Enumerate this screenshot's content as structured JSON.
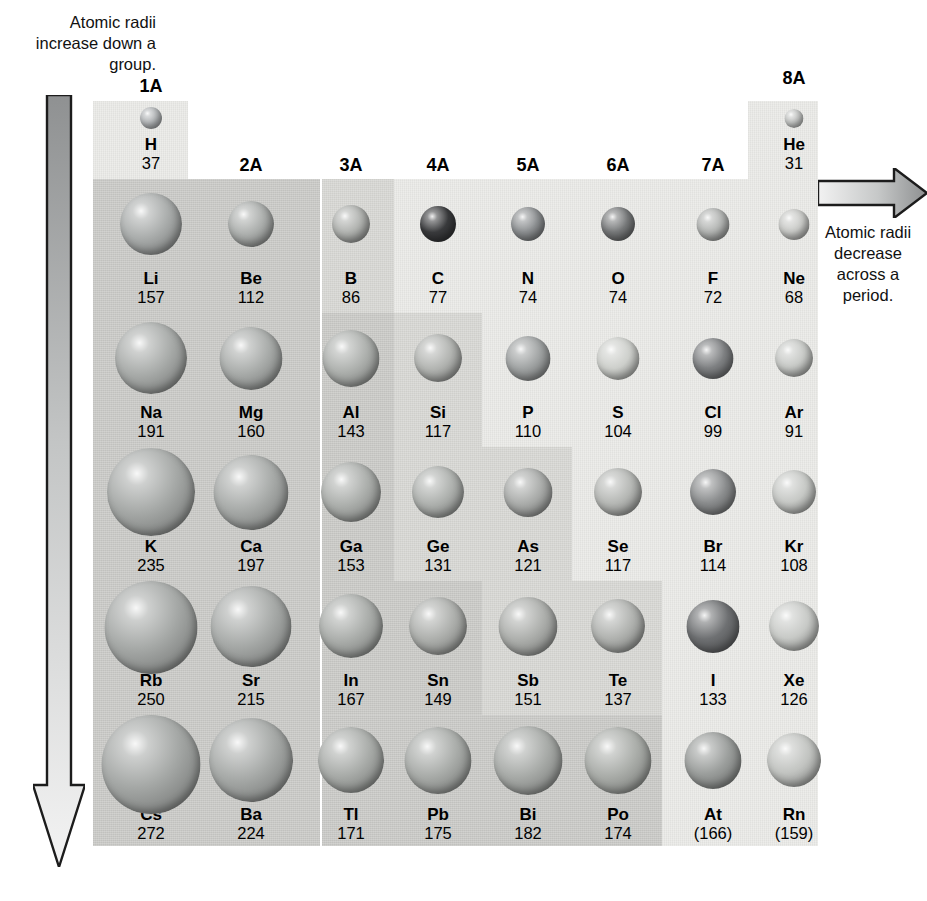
{
  "annotations": {
    "down": "Atomic radii increase down a group.",
    "across": "Atomic radii decrease across a period.",
    "down_icon": "down-arrow-icon",
    "across_icon": "right-arrow-icon"
  },
  "groups": [
    "1A",
    "2A",
    "3A",
    "4A",
    "5A",
    "6A",
    "7A",
    "8A"
  ],
  "chart_data": {
    "type": "table",
    "xlabel": "Group",
    "ylabel": "Period",
    "units": "pm",
    "categories": [
      "1A",
      "2A",
      "3A",
      "4A",
      "5A",
      "6A",
      "7A",
      "8A"
    ],
    "note": "Sphere diameter is proportional to the atomic radius value shown beneath each symbol. Values in parentheses are estimates.",
    "series": [
      {
        "name": "Period 1",
        "symbols": [
          "H",
          null,
          null,
          null,
          null,
          null,
          null,
          "He"
        ],
        "values": [
          37,
          null,
          null,
          null,
          null,
          null,
          null,
          31
        ]
      },
      {
        "name": "Period 2",
        "symbols": [
          "Li",
          "Be",
          "B",
          "C",
          "N",
          "O",
          "F",
          "Ne"
        ],
        "values": [
          157,
          112,
          86,
          77,
          74,
          74,
          72,
          68
        ]
      },
      {
        "name": "Period 3",
        "symbols": [
          "Na",
          "Mg",
          "Al",
          "Si",
          "P",
          "S",
          "Cl",
          "Ar"
        ],
        "values": [
          191,
          160,
          143,
          117,
          110,
          104,
          99,
          91
        ]
      },
      {
        "name": "Period 4",
        "symbols": [
          "K",
          "Ca",
          "Ga",
          "Ge",
          "As",
          "Se",
          "Br",
          "Kr"
        ],
        "values": [
          235,
          197,
          153,
          131,
          121,
          117,
          114,
          108
        ]
      },
      {
        "name": "Period 5",
        "symbols": [
          "Rb",
          "Sr",
          "In",
          "Sn",
          "Sb",
          "Te",
          "I",
          "Xe"
        ],
        "values": [
          250,
          215,
          167,
          149,
          151,
          137,
          133,
          126
        ]
      },
      {
        "name": "Period 6",
        "symbols": [
          "Cs",
          "Ba",
          "Tl",
          "Pb",
          "Bi",
          "Po",
          "At",
          "Rn"
        ],
        "values": [
          272,
          224,
          171,
          175,
          182,
          174,
          166,
          159
        ]
      }
    ]
  },
  "elements": [
    {
      "sym": "H",
      "val": "37",
      "grp": 1,
      "per": 1,
      "d": 22,
      "shade": "#b9bcbe"
    },
    {
      "sym": "He",
      "val": "31",
      "grp": 8,
      "per": 1,
      "d": 19,
      "shade": "#cfd1cf"
    },
    {
      "sym": "Li",
      "val": "157",
      "grp": 1,
      "per": 2,
      "d": 62,
      "shade": "#a9acab"
    },
    {
      "sym": "Be",
      "val": "112",
      "grp": 2,
      "per": 2,
      "d": 46,
      "shade": "#abaeac"
    },
    {
      "sym": "B",
      "val": "86",
      "grp": 3,
      "per": 2,
      "d": 38,
      "shade": "#b0b2af"
    },
    {
      "sym": "C",
      "val": "77",
      "grp": 4,
      "per": 2,
      "d": 36,
      "shade": "#3a3b3d"
    },
    {
      "sym": "N",
      "val": "74",
      "grp": 5,
      "per": 2,
      "d": 34,
      "shade": "#8e9193"
    },
    {
      "sym": "O",
      "val": "74",
      "grp": 6,
      "per": 2,
      "d": 34,
      "shade": "#797b7c"
    },
    {
      "sym": "F",
      "val": "72",
      "grp": 7,
      "per": 2,
      "d": 33,
      "shade": "#b3b5b3"
    },
    {
      "sym": "Ne",
      "val": "68",
      "grp": 8,
      "per": 2,
      "d": 31,
      "shade": "#cacbc8"
    },
    {
      "sym": "Na",
      "val": "191",
      "grp": 1,
      "per": 3,
      "d": 72,
      "shade": "#a8aba9"
    },
    {
      "sym": "Mg",
      "val": "160",
      "grp": 2,
      "per": 3,
      "d": 63,
      "shade": "#a9acaa"
    },
    {
      "sym": "Al",
      "val": "143",
      "grp": 3,
      "per": 3,
      "d": 57,
      "shade": "#adb0ad"
    },
    {
      "sym": "Si",
      "val": "117",
      "grp": 4,
      "per": 3,
      "d": 48,
      "shade": "#b2b4b1"
    },
    {
      "sym": "P",
      "val": "110",
      "grp": 5,
      "per": 3,
      "d": 45,
      "shade": "#9fa2a2"
    },
    {
      "sym": "S",
      "val": "104",
      "grp": 6,
      "per": 3,
      "d": 43,
      "shade": "#cdcfcb"
    },
    {
      "sym": "Cl",
      "val": "99",
      "grp": 7,
      "per": 3,
      "d": 41,
      "shade": "#7f8183"
    },
    {
      "sym": "Ar",
      "val": "91",
      "grp": 8,
      "per": 3,
      "d": 38,
      "shade": "#c7c9c6"
    },
    {
      "sym": "K",
      "val": "235",
      "grp": 1,
      "per": 4,
      "d": 88,
      "shade": "#a6a9a7"
    },
    {
      "sym": "Ca",
      "val": "197",
      "grp": 2,
      "per": 4,
      "d": 75,
      "shade": "#a8aba9"
    },
    {
      "sym": "Ga",
      "val": "153",
      "grp": 3,
      "per": 4,
      "d": 60,
      "shade": "#abaeab"
    },
    {
      "sym": "Ge",
      "val": "131",
      "grp": 4,
      "per": 4,
      "d": 52,
      "shade": "#aeb1ae"
    },
    {
      "sym": "As",
      "val": "121",
      "grp": 5,
      "per": 4,
      "d": 49,
      "shade": "#aaacaa"
    },
    {
      "sym": "Se",
      "val": "117",
      "grp": 6,
      "per": 4,
      "d": 48,
      "shade": "#b6b8b5"
    },
    {
      "sym": "Br",
      "val": "114",
      "grp": 7,
      "per": 4,
      "d": 46,
      "shade": "#8b8d8e"
    },
    {
      "sym": "Kr",
      "val": "108",
      "grp": 8,
      "per": 4,
      "d": 44,
      "shade": "#c6c8c5"
    },
    {
      "sym": "Rb",
      "val": "250",
      "grp": 1,
      "per": 5,
      "d": 93,
      "shade": "#a5a8a6"
    },
    {
      "sym": "Sr",
      "val": "215",
      "grp": 2,
      "per": 5,
      "d": 81,
      "shade": "#a7aaa8"
    },
    {
      "sym": "In",
      "val": "167",
      "grp": 3,
      "per": 5,
      "d": 64,
      "shade": "#aaadaa"
    },
    {
      "sym": "Sn",
      "val": "149",
      "grp": 4,
      "per": 5,
      "d": 58,
      "shade": "#adafac"
    },
    {
      "sym": "Sb",
      "val": "151",
      "grp": 5,
      "per": 5,
      "d": 59,
      "shade": "#acaeab"
    },
    {
      "sym": "Te",
      "val": "137",
      "grp": 6,
      "per": 5,
      "d": 54,
      "shade": "#b0b2af"
    },
    {
      "sym": "I",
      "val": "133",
      "grp": 7,
      "per": 5,
      "d": 53,
      "shade": "#6e7072"
    },
    {
      "sym": "Xe",
      "val": "126",
      "grp": 8,
      "per": 5,
      "d": 50,
      "shade": "#c8cac7"
    },
    {
      "sym": "Cs",
      "val": "272",
      "grp": 1,
      "per": 6,
      "d": 99,
      "shade": "#a4a7a5"
    },
    {
      "sym": "Ba",
      "val": "224",
      "grp": 2,
      "per": 6,
      "d": 84,
      "shade": "#a6a9a7"
    },
    {
      "sym": "Tl",
      "val": "171",
      "grp": 3,
      "per": 6,
      "d": 66,
      "shade": "#a9aca9"
    },
    {
      "sym": "Pb",
      "val": "175",
      "grp": 4,
      "per": 6,
      "d": 67,
      "shade": "#a9aca9"
    },
    {
      "sym": "Bi",
      "val": "182",
      "grp": 5,
      "per": 6,
      "d": 69,
      "shade": "#a8aba8"
    },
    {
      "sym": "Po",
      "val": "174",
      "grp": 6,
      "per": 6,
      "d": 67,
      "shade": "#aaada9"
    },
    {
      "sym": "At",
      "val": "(166)",
      "grp": 7,
      "per": 6,
      "d": 57,
      "shade": "#9b9e9c"
    },
    {
      "sym": "Rn",
      "val": "(159)",
      "grp": 8,
      "per": 6,
      "d": 54,
      "shade": "#c2c4c1"
    }
  ]
}
